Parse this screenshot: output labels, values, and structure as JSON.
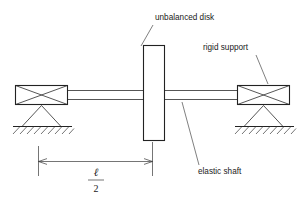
{
  "figure": {
    "title_role": "rotor-dynamics-schematic",
    "background_color": "#ffffff",
    "line_color": "#222222",
    "leader_color": "#555555",
    "width": 305,
    "height": 207
  },
  "labels": {
    "disk": "unbalanced disk",
    "support": "rigid support",
    "shaft": "elastic shaft"
  },
  "dimension": {
    "numerator": "ℓ",
    "denominator": "2"
  },
  "parts": {
    "disk_name": "unbalanced-disk",
    "left_bearing_name": "left-rigid-support",
    "right_bearing_name": "right-rigid-support",
    "shaft_name": "elastic-shaft",
    "ground_name": "hatched-ground"
  }
}
